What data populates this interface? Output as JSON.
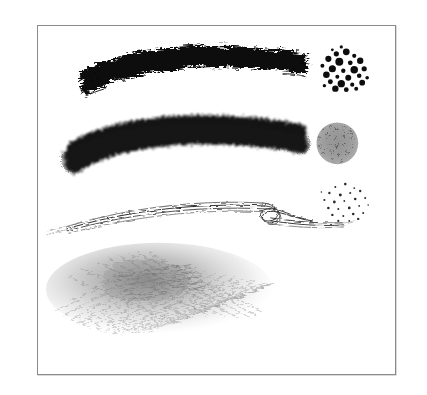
{
  "page": {
    "background_color": "#ffffff",
    "width": 427,
    "height": 395
  },
  "frame": {
    "name": "plate-border",
    "border_color": "#8b8b8f",
    "fill_color": "#ffffff",
    "x": 37,
    "y": 25,
    "width": 359,
    "height": 350
  },
  "samples": [
    {
      "id": "stroke-bristle-dry",
      "label": "Dry bristle brush stroke",
      "kind": "stroke",
      "ink_color": "#0c0c0c",
      "bbox": [
        78,
        48,
        228,
        53
      ],
      "description": "Solid black arched stroke with ragged frayed bristle edges and split hairs at both ends"
    },
    {
      "id": "stroke-soft-airbrush",
      "label": "Soft grainy airbrush stroke",
      "kind": "stroke",
      "ink_color": "#121212",
      "bbox": [
        62,
        117,
        243,
        60
      ],
      "description": "Arched stroke with dense grainy core fading to soft speckled edges"
    },
    {
      "id": "stroke-rake-calligraphic",
      "label": "Fine rake calligraphic stroke",
      "kind": "stroke",
      "ink_color": "#3a3a3a",
      "bbox": [
        64,
        188,
        284,
        42
      ],
      "description": "Thin multi-line tapered stroke that loops and crosses near the right, trailing to a fine point at the left"
    },
    {
      "id": "smudge-pencil-cloud",
      "label": "Hatched pencil smudge",
      "kind": "smudge",
      "ink_color": "#9a9a9a",
      "bbox": [
        104,
        243,
        228,
        95
      ],
      "description": "Light gray cloud of fine hatching strokes, densest near the upper middle"
    },
    {
      "id": "texture-coarse-spatter",
      "label": "Coarse spatter dots",
      "kind": "texture",
      "ink_color": "#0d0d0d",
      "bbox": [
        329,
        47,
        42,
        42
      ],
      "description": "Cluster of large solid round ink dots of varied size"
    },
    {
      "id": "texture-noise-disc",
      "label": "Grainy noise disc",
      "kind": "texture",
      "ink_color": "#8e8e8e",
      "bbox": [
        317,
        121,
        42,
        43
      ],
      "description": "Round patch of medium gray noise with soft feathered edge"
    },
    {
      "id": "texture-fine-spatter",
      "label": "Fine sparse spatter dots",
      "kind": "texture",
      "ink_color": "#2b2b2b",
      "bbox": [
        321,
        182,
        45,
        40
      ],
      "description": "Loose scattering of small dark dots"
    }
  ]
}
